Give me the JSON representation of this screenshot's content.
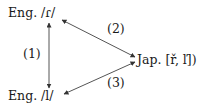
{
  "nodes": {
    "eng_r": "Eng. /ɾ/",
    "eng_l": "Eng. /l/",
    "jap": "Jap. [ř, ľ])"
  },
  "edges": {
    "e1": "(1)",
    "e2": "(2)",
    "e3": "(3)"
  },
  "colors": {
    "text": "#1a1a1a",
    "arrow": "#555555"
  }
}
